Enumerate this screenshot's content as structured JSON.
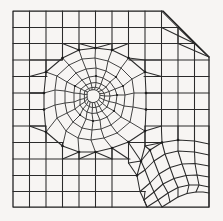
{
  "figure": {
    "title": "Finite element mesh of a square domain with chamfered corner",
    "kind": "mesh-diagram",
    "width": 223,
    "height": 221,
    "background_color": "#f7f5f3",
    "line_color": "#2b2b2b",
    "boundary_color": "#1c1c1c"
  },
  "chart_data": {
    "type": "diagram",
    "title": "Finite element mesh of a square domain with chamfered corner",
    "subtitle": "",
    "xlabel": "",
    "ylabel": "",
    "grid": false,
    "legend_position": "none",
    "regions": [
      {
        "name": "outer-cartesian-grid",
        "element_type": "quadrilateral",
        "columns": 12,
        "rows": 12,
        "note": "Regular background grid spanning the plate"
      },
      {
        "name": "central-polar-patch",
        "element_type": "quadrilateral",
        "center": [
          90,
          92
        ],
        "rings": 7,
        "sectors": 16,
        "outer_radius": 46,
        "inner_radius": 3,
        "note": "Radial ring refinement around a central point"
      },
      {
        "name": "lower-right-fan",
        "element_type": "quadrilateral",
        "center": [
          152,
          196
        ],
        "rings": 5,
        "sectors": 7,
        "outer_radius": 56,
        "inner_radius": 12,
        "note": "Quarter-circle graded boundary-layer fan"
      },
      {
        "name": "transition-triangles",
        "element_type": "triangle",
        "count": 32,
        "note": "Triangular elements stitching the polar patches to the Cartesian grid"
      }
    ],
    "domain": {
      "shape": "square-with-chamfer",
      "corners": [
        [
          13,
          11
        ],
        [
          163,
          11
        ],
        [
          209,
          57
        ],
        [
          209,
          207
        ],
        [
          13,
          207
        ]
      ],
      "chamfer_corner": "top-right",
      "chamfer_angle_deg": 45
    },
    "counts": {
      "nodes": 214,
      "elements": 196,
      "quadrilaterals": 164,
      "triangles": 32
    }
  }
}
